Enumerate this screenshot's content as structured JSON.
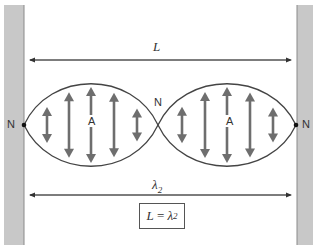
{
  "diagram": {
    "labels": {
      "length": "L",
      "wavelength": "λ2",
      "wavelength_base": "λ",
      "wavelength_sub": "2",
      "node": "N",
      "antinode": "A",
      "formula_lhs": "L",
      "formula_eq": " = ",
      "formula_rhs_base": "λ",
      "formula_rhs_sub": "2"
    },
    "nodes": [
      {
        "label": "N",
        "x": 24,
        "y": 125
      },
      {
        "label": "N",
        "x": 158,
        "y": 125
      },
      {
        "label": "N",
        "x": 296,
        "y": 125
      }
    ],
    "antinodes": [
      {
        "label": "A",
        "x": 91,
        "y": 125
      },
      {
        "label": "A",
        "x": 227,
        "y": 125
      }
    ],
    "colors": {
      "wall": "#c8c8c8",
      "wall_edge": "#9a9a9a",
      "arrow": "#6e6e6e",
      "line": "#333333",
      "curve": "#444444"
    }
  }
}
